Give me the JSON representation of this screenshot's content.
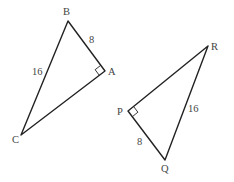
{
  "diagram": {
    "type": "two right triangles",
    "line_color": "#222222",
    "label_color": "#444444",
    "triangles": [
      {
        "name": "ABC",
        "right_angle_at": "A",
        "vertices": [
          {
            "label": "B",
            "x": 68,
            "y": 21
          },
          {
            "label": "A",
            "x": 105,
            "y": 71
          },
          {
            "label": "C",
            "x": 21,
            "y": 135
          }
        ],
        "side_labels": [
          {
            "side": "AB",
            "text": "8"
          },
          {
            "side": "BC",
            "text": "16"
          }
        ]
      },
      {
        "name": "PQR",
        "right_angle_at": "P",
        "vertices": [
          {
            "label": "R",
            "x": 208,
            "y": 46
          },
          {
            "label": "P",
            "x": 128,
            "y": 111
          },
          {
            "label": "Q",
            "x": 165,
            "y": 160
          }
        ],
        "side_labels": [
          {
            "side": "PQ",
            "text": "8"
          },
          {
            "side": "QR",
            "text": "16"
          }
        ]
      }
    ]
  }
}
